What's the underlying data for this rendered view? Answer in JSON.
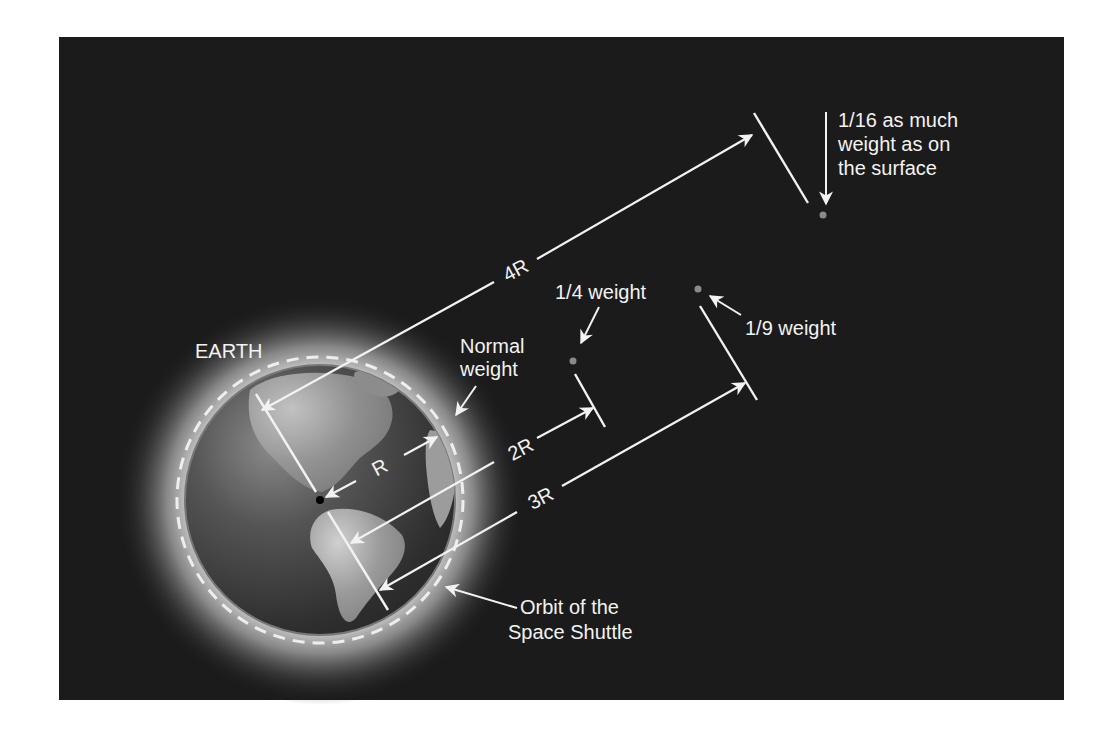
{
  "diagram": {
    "background": "#ffffff",
    "panel_color": "#1b1b1b",
    "line_color": "#f2f2f2",
    "earth_label": "EARTH",
    "distance_labels": {
      "r": "R",
      "two_r": "2R",
      "three_r": "3R",
      "four_r": "4R"
    },
    "annotations": {
      "normal_weight": [
        "Normal",
        "weight"
      ],
      "quarter_weight": "1/4 weight",
      "ninth_weight": "1/9 weight",
      "sixteenth_weight": [
        "1/16 as much",
        "weight as on",
        "the surface"
      ],
      "orbit": [
        "Orbit of the",
        "Space Shuttle"
      ]
    }
  }
}
